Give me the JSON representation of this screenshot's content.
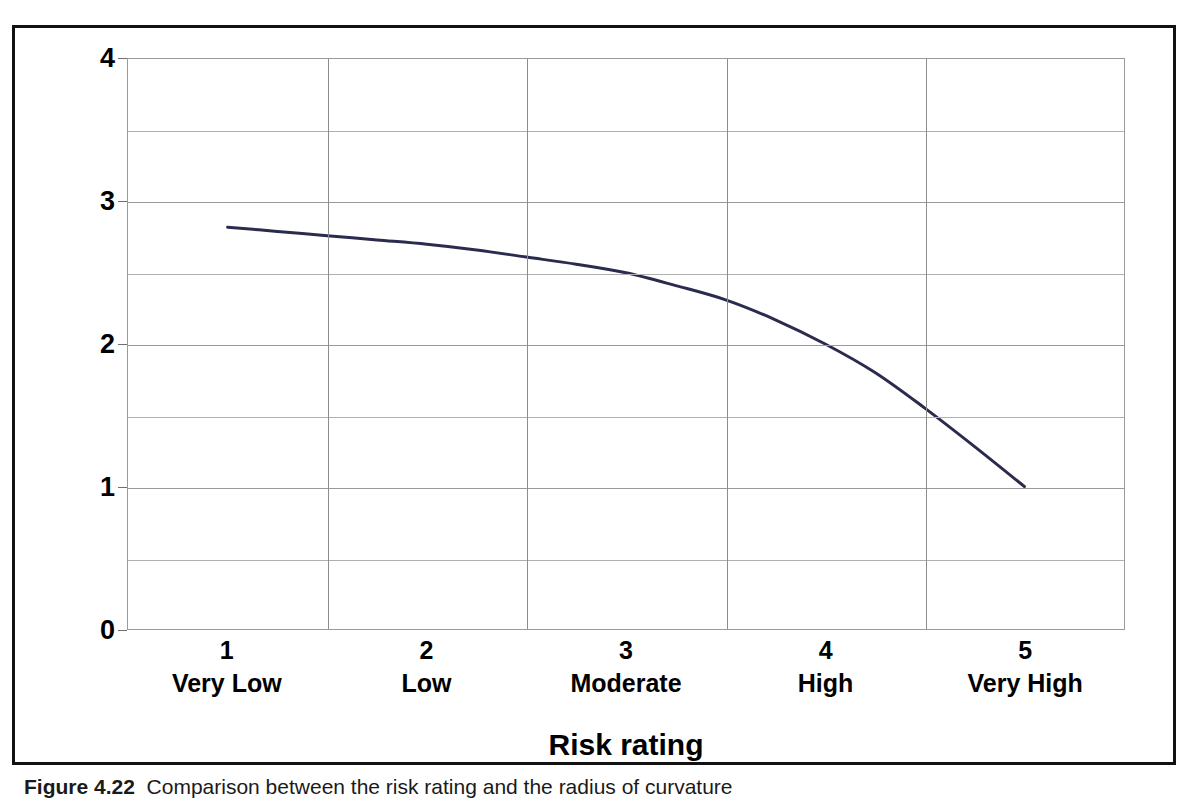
{
  "figure": {
    "caption_label": "Figure 4.22",
    "caption_text": "Comparison  between  the  risk  rating  and  the  radius  of  curvature",
    "frame_color": "#111111"
  },
  "chart_data": {
    "type": "line",
    "title": "",
    "xlabel": "Risk rating",
    "ylabel": "Radius of curvature/ width",
    "categories": [
      "1",
      "2",
      "3",
      "4",
      "5"
    ],
    "category_names": [
      "Very Low",
      "Low",
      "Moderate",
      "High",
      "Very High"
    ],
    "series": [
      {
        "name": "Radius of curvature/ width",
        "color": "#2b2b4f",
        "values": [
          2.82,
          2.7,
          2.5,
          2.0,
          1.0
        ]
      }
    ],
    "x": [
      1,
      2,
      3,
      4,
      5
    ],
    "curve_points": [
      [
        1.0,
        2.82
      ],
      [
        1.25,
        2.79
      ],
      [
        1.5,
        2.76
      ],
      [
        1.75,
        2.73
      ],
      [
        2.0,
        2.7
      ],
      [
        2.25,
        2.66
      ],
      [
        2.5,
        2.61
      ],
      [
        2.75,
        2.56
      ],
      [
        3.0,
        2.5
      ],
      [
        3.25,
        2.41
      ],
      [
        3.5,
        2.31
      ],
      [
        3.75,
        2.17
      ],
      [
        4.0,
        2.0
      ],
      [
        4.25,
        1.8
      ],
      [
        4.5,
        1.55
      ],
      [
        4.75,
        1.28
      ],
      [
        5.0,
        1.0
      ]
    ],
    "ylim": [
      0,
      4
    ],
    "y_major_ticks": [
      "0",
      "1",
      "2",
      "3",
      "4"
    ],
    "y_major_values": [
      0,
      1,
      2,
      3,
      4
    ],
    "y_minor_values": [
      0.5,
      1.5,
      2.5,
      3.5
    ],
    "xlim": [
      0.5,
      5.5
    ],
    "x_gridline_values": [
      1.5,
      2.5,
      3.5,
      4.5
    ],
    "grid": "both",
    "legend": "none",
    "smooth": true,
    "line_width": 3
  }
}
